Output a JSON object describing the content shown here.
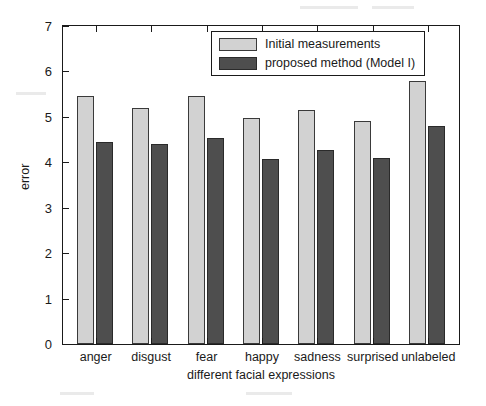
{
  "chart_data": {
    "type": "bar",
    "title": "",
    "xlabel": "different facial expressions",
    "ylabel": "error",
    "categories": [
      "anger",
      "disgust",
      "fear",
      "happy",
      "sadness",
      "surprised",
      "unlabeled"
    ],
    "series": [
      {
        "name": "Initial measurements",
        "color": "#d2d2d2",
        "values": [
          5.45,
          5.2,
          5.46,
          4.97,
          5.15,
          4.9,
          5.78
        ]
      },
      {
        "name": "proposed method (Model I)",
        "color": "#4e4e4e",
        "values": [
          4.45,
          4.4,
          4.53,
          4.08,
          4.28,
          4.1,
          4.8
        ]
      }
    ],
    "ylim": [
      0,
      7
    ],
    "yticks": [
      0,
      1,
      2,
      3,
      4,
      5,
      6,
      7
    ],
    "ytick_labels": [
      "0",
      "1",
      "2",
      "3",
      "4",
      "5",
      "6",
      "7"
    ],
    "grid": false,
    "legend_position": "top-center",
    "axes_color": "#1a1a1a",
    "background_color": "#ffffff"
  }
}
